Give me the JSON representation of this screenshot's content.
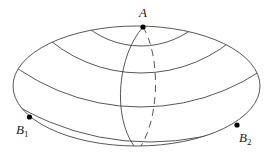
{
  "diagram": {
    "shape": "ellipse",
    "stroke_color": "#444444",
    "point_color": "#000000",
    "points": [
      {
        "id": "A",
        "label": "A",
        "subscript": ""
      },
      {
        "id": "B1",
        "label": "B",
        "subscript": "1"
      },
      {
        "id": "B2",
        "label": "B",
        "subscript": "2"
      }
    ],
    "meridians": [
      {
        "style": "solid",
        "from": "A",
        "to": "bottom"
      },
      {
        "style": "dashed",
        "from": "A",
        "to": "bottom"
      }
    ],
    "arc_family": "concentric curves around A"
  }
}
